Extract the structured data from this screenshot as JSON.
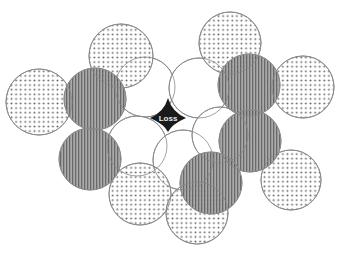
{
  "diagram": {
    "center_label": "Loss",
    "colors": {
      "background": "#ffffff",
      "outline": "#8a8a8a",
      "dot": "#555555",
      "stripe_bg": "#9a9a9a",
      "stripe_line": "#5a5a5a",
      "white_fill": "#ffffff",
      "center_fill": "#1a1a1a",
      "center_text": "#e8e8e8"
    },
    "circles": [
      {
        "id": "white-1",
        "style": "white",
        "cx": 145,
        "cy": 87,
        "r": 30
      },
      {
        "id": "white-2",
        "style": "white",
        "cx": 199,
        "cy": 88,
        "r": 30
      },
      {
        "id": "white-3",
        "style": "white",
        "cx": 137,
        "cy": 146,
        "r": 30
      },
      {
        "id": "white-4",
        "style": "white",
        "cx": 183,
        "cy": 160,
        "r": 30
      },
      {
        "id": "white-5",
        "style": "white",
        "cx": 220,
        "cy": 135,
        "r": 28
      },
      {
        "id": "dotted-1",
        "style": "dotted",
        "cx": 121,
        "cy": 56,
        "r": 32
      },
      {
        "id": "dotted-2",
        "style": "dotted",
        "cx": 230,
        "cy": 43,
        "r": 31
      },
      {
        "id": "dotted-3",
        "style": "dotted",
        "cx": 303,
        "cy": 87,
        "r": 31
      },
      {
        "id": "dotted-4",
        "style": "dotted",
        "cx": 39,
        "cy": 102,
        "r": 33
      },
      {
        "id": "dotted-5",
        "style": "dotted",
        "cx": 140,
        "cy": 194,
        "r": 31
      },
      {
        "id": "dotted-6",
        "style": "dotted",
        "cx": 197,
        "cy": 213,
        "r": 31
      },
      {
        "id": "dotted-7",
        "style": "dotted",
        "cx": 291,
        "cy": 180,
        "r": 30
      },
      {
        "id": "striped-1",
        "style": "striped",
        "cx": 95,
        "cy": 99,
        "r": 31
      },
      {
        "id": "striped-2",
        "style": "striped",
        "cx": 249,
        "cy": 85,
        "r": 31
      },
      {
        "id": "striped-3",
        "style": "striped",
        "cx": 90,
        "cy": 159,
        "r": 31
      },
      {
        "id": "striped-4",
        "style": "striped",
        "cx": 250,
        "cy": 141,
        "r": 31
      },
      {
        "id": "striped-5",
        "style": "striped",
        "cx": 211,
        "cy": 183,
        "r": 31
      }
    ],
    "center_shape": {
      "cx": 168,
      "cy": 118
    }
  }
}
